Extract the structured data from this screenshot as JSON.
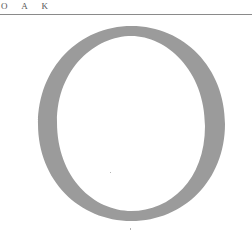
{
  "header": {
    "title_spaced": "O A K"
  },
  "illustration": {
    "letter": "O",
    "icon": "large-letter-o",
    "color": "#9b9b9b"
  },
  "colors": {
    "background": "#ffffff",
    "rule": "#8a8a8a",
    "title_text": "#555555"
  }
}
